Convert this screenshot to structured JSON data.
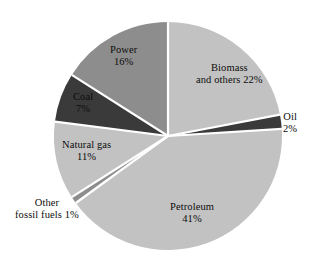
{
  "chart_data": {
    "type": "pie",
    "title": "",
    "subtitle": "",
    "xlabel": "",
    "ylabel": "",
    "legend_position": "none",
    "grid": false,
    "labels_inside": true,
    "unit": "%",
    "start_angle_deg": 0,
    "direction": "clockwise",
    "categories": [
      "Biomass and others",
      "Oil",
      "Petroleum",
      "Other fossil fuels",
      "Natural gas",
      "Coal",
      "Power"
    ],
    "values": [
      22,
      2,
      41,
      1,
      11,
      16,
      7
    ],
    "slices": [
      {
        "name": "Biomass and others",
        "value": 22,
        "label_line1": "Biomass",
        "label_line2": "and others 22%",
        "percent_text": "22%",
        "color": "#c2c2c2",
        "label_x": 196,
        "label_y": 62
      },
      {
        "name": "Oil",
        "value": 2,
        "label_line1": "Oil",
        "label_line2": "2%",
        "percent_text": "2%",
        "color": "#3a3a3a",
        "label_x": 283,
        "label_y": 111
      },
      {
        "name": "Petroleum",
        "value": 41,
        "label_line1": "Petroleum",
        "label_line2": "41%",
        "percent_text": "41%",
        "color": "#c2c2c2",
        "label_x": 170,
        "label_y": 201
      },
      {
        "name": "Other fossil fuels",
        "value": 1,
        "label_line1": "Other",
        "label_line2": "fossil fuels 1%",
        "percent_text": "1%",
        "color": "#8d8d8d",
        "label_x": 15,
        "label_y": 197
      },
      {
        "name": "Natural gas",
        "value": 11,
        "label_line1": "Natural gas",
        "label_line2": "11%",
        "percent_text": "11%",
        "color": "#c2c2c2",
        "label_x": 62,
        "label_y": 139
      },
      {
        "name": "Coal",
        "value": 7,
        "label_line1": "Coal",
        "label_line2": "7%",
        "percent_text": "7%",
        "color": "#3a3a3a",
        "label_x": 73,
        "label_y": 91
      },
      {
        "name": "Power",
        "value": 16,
        "label_line1": "Power",
        "label_line2": "16%",
        "percent_text": "16%",
        "color": "#8d8d8d",
        "label_x": 110,
        "label_y": 44
      }
    ],
    "geometry": {
      "center_x": 168,
      "center_y": 136,
      "radius": 114,
      "separator_color": "#ffffff",
      "separator_width": 2.2,
      "background": "#ffffff"
    },
    "colors": {
      "light_gray": "#c2c2c2",
      "medium_gray": "#8d8d8d",
      "dark_gray": "#3a3a3a",
      "separator": "#ffffff",
      "text": "#0d0d0d"
    }
  }
}
